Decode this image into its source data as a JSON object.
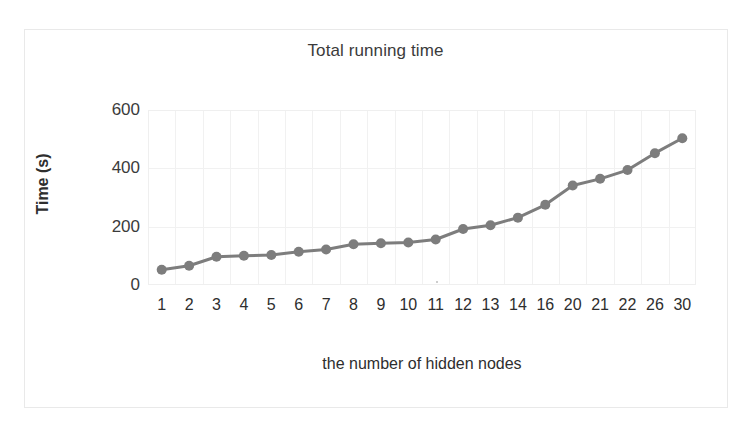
{
  "figure": {
    "background_color": "#ffffff",
    "frame_color": "#e9e9e9"
  },
  "chart_data": {
    "type": "line",
    "title": "Total running time",
    "xlabel": "the number of hidden nodes",
    "ylabel": "Time (s)",
    "categories": [
      "1",
      "2",
      "3",
      "4",
      "5",
      "6",
      "7",
      "8",
      "9",
      "10",
      "11",
      "12",
      "13",
      "14",
      "16",
      "20",
      "21",
      "22",
      "26",
      "30"
    ],
    "values": [
      52,
      66,
      97,
      100,
      103,
      114,
      122,
      140,
      143,
      146,
      156,
      192,
      205,
      231,
      275,
      341,
      364,
      394,
      452,
      503
    ],
    "series": [
      {
        "name": "Total running time",
        "values": [
          52,
          66,
          97,
          100,
          103,
          114,
          122,
          140,
          143,
          146,
          156,
          192,
          205,
          231,
          275,
          341,
          364,
          394,
          452,
          503
        ],
        "color": "#7d7d7d",
        "marker": "circle",
        "line_width": 3
      }
    ],
    "ylim": [
      0,
      600
    ],
    "yticks": [
      0,
      200,
      400,
      600
    ],
    "ytick_labels": [
      "0",
      "200",
      "400",
      "600"
    ],
    "grid": {
      "horizontal": true,
      "vertical": true,
      "color": "#f1f1f1"
    },
    "legend": {
      "visible": false,
      "position": "none"
    },
    "axis_line_color": "#efefef",
    "text_color": "#2e2e2e"
  }
}
